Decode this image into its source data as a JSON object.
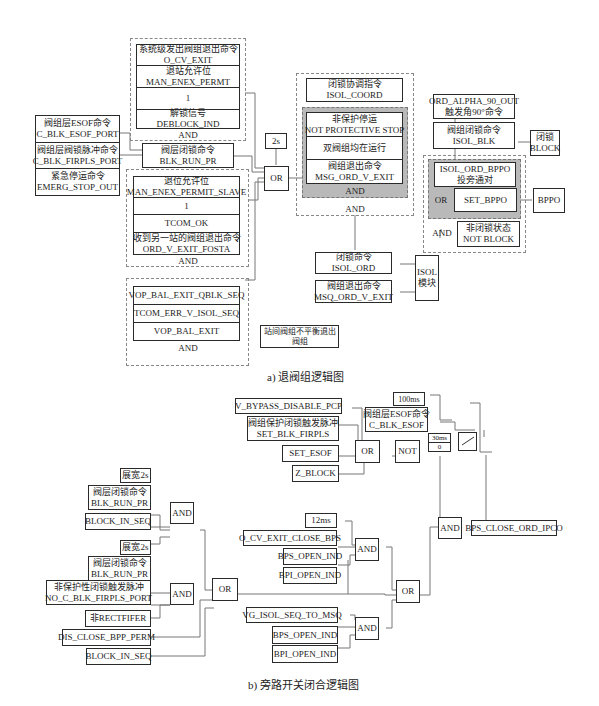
{
  "diagram_a": {
    "caption": "a) 退阀组逻辑图",
    "group1": {
      "rows": [
        [
          "系统级发出阀组退出命令",
          "O_CV_EXIT"
        ],
        [
          "退站允许位",
          "MAN_ENEX_PERMT"
        ],
        [
          "1"
        ],
        [
          "解锁信号",
          "DEBLOCK_IND"
        ]
      ],
      "gate": "AND"
    },
    "left_inputs": [
      [
        "阀组层ESOF命令",
        "C_BLK_ESOF_PORT"
      ],
      [
        "阀组层阀锁脉冲命令",
        "C_BLK_FIRPLS_PORT"
      ],
      [
        "紧急停运命令",
        "EMERG_STOP_OUT"
      ]
    ],
    "blk_run_pr": [
      "阀层闭锁命令",
      "BLK_RUN_PR"
    ],
    "group2": {
      "rows": [
        [
          "退位允许位",
          "MAN_ENEX_PERMIT_SLAVE"
        ],
        [
          "1"
        ],
        [
          "TCOM_OK"
        ],
        [
          "收到另一站的阀组退出命令",
          "ORD_V_EXIT_FOSTA"
        ]
      ],
      "gate": "AND"
    },
    "group3": {
      "rows": [
        [
          "VOP_BAL_EXIT_QBLK_SEQ"
        ],
        [
          "TCOM_ERR_V_ISOL_SEQ"
        ],
        [
          "VOP_BAL_EXIT"
        ]
      ],
      "gate": "AND"
    },
    "station_note": [
      "站间阀组不平衡退出",
      "阀组"
    ],
    "delay_2s": "2s",
    "or_gate": "OR",
    "center_group": {
      "isol_coord": [
        "闭锁协调指令",
        "ISOL_COORD"
      ],
      "grey_rows": [
        [
          "非保护停运",
          "NOT PROTECTIVE STOP"
        ],
        [
          "双阀组均在运行"
        ],
        [
          "阀组退出命令",
          "MSG_ORD_V_EXIT"
        ]
      ],
      "grey_gate": "AND",
      "outer_gate": "AND"
    },
    "isol_ord": [
      "闭锁命令",
      "ISOL_ORD"
    ],
    "msq_ord": [
      "阀组退出命令",
      "MSQ_ORD_V_EXIT"
    ],
    "isol_module": [
      "ISOL",
      "模块"
    ],
    "right_group": {
      "alpha90": [
        "ORD_ALPHA_90_OUT",
        "触发角90°命令"
      ],
      "isol_blk": [
        "阀组闭锁命令",
        "ISOL_BLK"
      ],
      "grey_row1": [
        "ISOL_ORD_BPPO",
        "投旁通对"
      ],
      "grey_or": "OR",
      "set_bppo": "SET_BPPO",
      "and_label": "AND",
      "not_block": [
        "非闭锁状态",
        "NOT BLOCK"
      ]
    },
    "block_out": [
      "闭锁",
      "BLOCK"
    ],
    "bppo_out": "BPPO"
  },
  "diagram_b": {
    "caption": "b) 旁路开关闭合逻辑图",
    "top_inputs": [
      [
        "V_BYPASS_DISABLE_PCP"
      ],
      [
        "阀组保护闭锁触发脉冲",
        "SET_BLK_FIRPLS"
      ],
      [
        "SET_ESOF"
      ],
      [
        "Z_BLOCK"
      ]
    ],
    "or1": "OR",
    "not1": "NOT",
    "delay_100ms": "100ms",
    "esof_cmd": [
      "阀组层ESOF命令",
      "C_BLK_ESOF"
    ],
    "timer": [
      "30ms",
      "0"
    ],
    "and_final": "AND",
    "output": "BPS_CLOSE_ORD_IPCO",
    "left_group1": [
      [
        "展宽2s"
      ],
      [
        "阀层闭锁命令",
        "BLK_RUN_PR"
      ],
      [
        "BLOCK_IN_SEQ"
      ]
    ],
    "left_and1": "AND",
    "left_group2": [
      [
        "展宽2s"
      ],
      [
        "阀层闭锁命令",
        "BLK_RUN_PR"
      ],
      [
        "非保护性闭锁触发脉冲",
        "NO_C_BLK_FIRPLS_PORT"
      ],
      [
        "非RECTFIFER"
      ]
    ],
    "left_and2": "AND",
    "dis_close": "DIS_CLOSE_BPP_PERM",
    "block_in_seq2": "BLOCK_IN_SEQ",
    "left_or": "OR",
    "mid_group1": [
      [
        "12ms"
      ],
      [
        "O_CV_EXIT_CLOSE_BPS"
      ],
      [
        "BPS_OPEN_IND"
      ],
      [
        "BPI_OPEN_IND"
      ]
    ],
    "mid_and1": "AND",
    "mid_group2": [
      [
        "VG_ISOL_SEQ_TO_MSQ"
      ],
      [
        "BPS_OPEN_IND"
      ],
      [
        "BPI_OPEN_IND"
      ]
    ],
    "mid_and2": "AND",
    "mid_or": "OR"
  }
}
